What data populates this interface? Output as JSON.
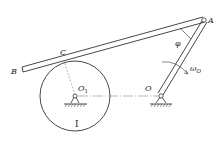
{
  "diagram": {
    "type": "mechanism",
    "labels": {
      "A": "A",
      "B": "B",
      "C": "C",
      "O1": "O",
      "O1_sub": "1",
      "O": "O",
      "phi": "φ",
      "omega": "ω",
      "omega_sub": "O",
      "disk": "I"
    },
    "colors": {
      "stroke": "#333333",
      "dash": "#777777",
      "background": "#ffffff"
    }
  }
}
